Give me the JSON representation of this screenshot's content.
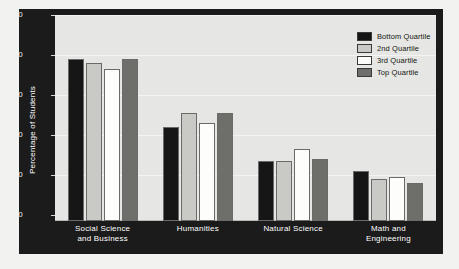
{
  "chart_data": {
    "type": "bar",
    "title": "",
    "xlabel": "",
    "ylabel": "Percentage of Students",
    "ylim": [
      0,
      50
    ],
    "yticks": [
      "0",
      "10",
      "20",
      "30",
      "40",
      "50"
    ],
    "grid": true,
    "legend_position": "top-right",
    "categories": [
      "Social Science and Business",
      "Humanities",
      "Natural Science",
      "Math and Engineering"
    ],
    "category_lines": [
      [
        "Social Science",
        "and Business"
      ],
      [
        "Humanities"
      ],
      [
        "Natural Science"
      ],
      [
        "Math and",
        "Engineering"
      ]
    ],
    "series": [
      {
        "name": "Bottom Quartile",
        "color": "#161616",
        "values": [
          40.5,
          23.5,
          15.0,
          12.5
        ]
      },
      {
        "name": "2nd Quartile",
        "color": "#c9cac6",
        "values": [
          39.5,
          27.0,
          15.0,
          10.5
        ]
      },
      {
        "name": "3rd Quartile",
        "color": "#fdfdfb",
        "values": [
          38.0,
          24.5,
          18.0,
          11.0
        ]
      },
      {
        "name": "Top Quartile",
        "color": "#6e6f6b",
        "values": [
          40.5,
          27.0,
          15.5,
          9.5
        ]
      }
    ]
  },
  "legend": {
    "items": [
      {
        "label": "Bottom Quartile"
      },
      {
        "label": "2nd Quartile"
      },
      {
        "label": "3rd Quartile"
      },
      {
        "label": "Top Quartile"
      }
    ]
  },
  "colors": {
    "page_background": "#f2f2f0",
    "frame": "#1b1b1b",
    "plot_background": "#e6e7e5",
    "gridline": "#f4f4f2",
    "axis_text": "#f0f0f0"
  }
}
